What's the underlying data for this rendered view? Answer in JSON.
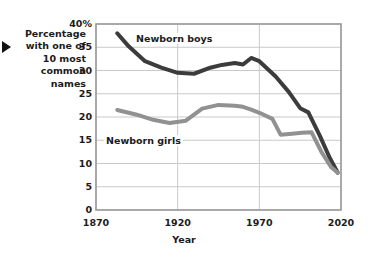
{
  "axis_note": {
    "lines": [
      "Percentage",
      "with one of",
      "10 most",
      "common",
      "names"
    ],
    "pointer_icon": "triangle-right-icon"
  },
  "colors": {
    "boys_line": "#3c3c3c",
    "girls_line": "#919191",
    "grid": "#c9c9c9",
    "axis": "#9a9a9a",
    "background": "#ffffff",
    "text": "#1b1b1b"
  },
  "chart_data": {
    "type": "line",
    "title": "",
    "xlabel": "Year",
    "ylabel": "Percentage with one of 10 most common names",
    "xlim": [
      1870,
      2020
    ],
    "ylim": [
      0,
      40
    ],
    "grid": true,
    "legend_position": "inline-annotations",
    "xticks": [
      1870,
      1920,
      1970,
      2020
    ],
    "xticklabels": [
      "1870",
      "1920",
      "1970",
      "2020"
    ],
    "yticks": [
      0,
      5,
      10,
      15,
      20,
      25,
      30,
      35,
      40
    ],
    "yticklabels": [
      "0",
      "5",
      "10",
      "15",
      "20",
      "25",
      "30",
      "35",
      "40%"
    ],
    "series": [
      {
        "name": "Newborn boys",
        "color": "#3c3c3c",
        "x": [
          1883,
          1890,
          1900,
          1910,
          1920,
          1930,
          1940,
          1947,
          1955,
          1960,
          1965,
          1970,
          1980,
          1988,
          1995,
          2000,
          2007,
          2013,
          2018
        ],
        "values": [
          38.0,
          35.2,
          32.0,
          30.6,
          29.5,
          29.3,
          30.6,
          31.2,
          31.6,
          31.3,
          32.7,
          32.0,
          28.7,
          25.4,
          21.9,
          21.0,
          16.0,
          11.3,
          8.0
        ]
      },
      {
        "name": "Newborn girls",
        "color": "#919191",
        "x": [
          1883,
          1895,
          1905,
          1915,
          1925,
          1935,
          1945,
          1955,
          1960,
          1965,
          1972,
          1978,
          1983,
          1990,
          1996,
          2002,
          2008,
          2014,
          2018
        ],
        "values": [
          21.5,
          20.5,
          19.4,
          18.7,
          19.2,
          21.8,
          22.6,
          22.4,
          22.2,
          21.6,
          20.6,
          19.6,
          16.2,
          16.4,
          16.6,
          16.7,
          12.5,
          9.2,
          8.0
        ]
      }
    ],
    "annotations": [
      {
        "text": "Newborn boys",
        "series": "Newborn boys"
      },
      {
        "text": "Newborn girls",
        "series": "Newborn girls"
      }
    ]
  }
}
